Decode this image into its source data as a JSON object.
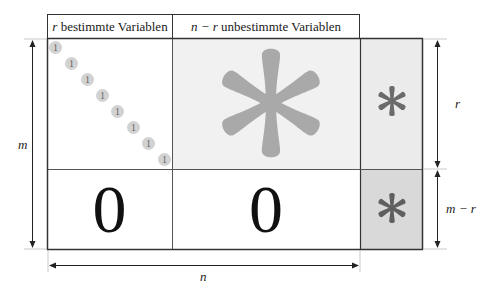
{
  "diagram": {
    "header": {
      "left_var": "r",
      "left_text": " bestimmte Variablen",
      "right_var": "n − r",
      "right_text": " unbestimmte Variablen"
    },
    "blocks": {
      "identity_diagonal": [
        "1",
        "1",
        "1",
        "1",
        "1",
        "1",
        "1",
        "1"
      ],
      "top_right_symbol": "*",
      "rhs_top_symbol": "*",
      "bottom_left": "0",
      "bottom_middle": "0",
      "rhs_bottom_symbol": "*"
    },
    "dimensions": {
      "rows_total": "m",
      "rows_top": "r",
      "rows_bottom": "m − r",
      "cols_total": "n"
    },
    "colors": {
      "outline": "#333333",
      "top_right_fill": "#f1f1f1",
      "rhs_top_fill": "#ebebeb",
      "rhs_bottom_fill": "#d9d9d9",
      "asterisk_large": "#a9a9a9",
      "asterisk_small": "#6b6b6b",
      "dot_fill": "#d2d2d2"
    }
  }
}
